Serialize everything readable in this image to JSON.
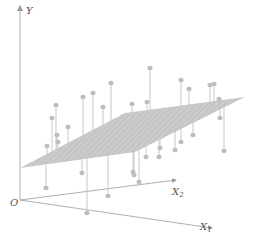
{
  "figure": {
    "axes": {
      "y_label": "Y",
      "x1_label": "X",
      "x1_sub": "1",
      "x2_label": "X",
      "x2_sub": "2",
      "origin_label": "O"
    },
    "colors": {
      "axis": "#9a9a9a",
      "plane": "#c4c4c4",
      "point": "#bdbdbd",
      "stem": "#c8c8c8",
      "label": "#555555"
    },
    "plane": {
      "corners": [
        [
          20,
          168
        ],
        [
          125,
          113
        ],
        [
          245,
          97
        ],
        [
          135,
          152
        ]
      ]
    },
    "points": [
      {
        "x": 52,
        "y": 118,
        "base": 152
      },
      {
        "x": 56,
        "y": 105,
        "base": 150
      },
      {
        "x": 68,
        "y": 127,
        "base": 150
      },
      {
        "x": 93,
        "y": 93,
        "base": 140
      },
      {
        "x": 83,
        "y": 97,
        "base": 142
      },
      {
        "x": 111,
        "y": 83,
        "base": 135
      },
      {
        "x": 103,
        "y": 107,
        "base": 137
      },
      {
        "x": 132,
        "y": 104,
        "base": 128
      },
      {
        "x": 147,
        "y": 102,
        "base": 124
      },
      {
        "x": 150,
        "y": 68,
        "base": 120
      },
      {
        "x": 181,
        "y": 80,
        "base": 113
      },
      {
        "x": 189,
        "y": 89,
        "base": 111
      },
      {
        "x": 210,
        "y": 85,
        "base": 104
      },
      {
        "x": 214,
        "y": 84,
        "base": 104
      },
      {
        "x": 219,
        "y": 99,
        "base": 103
      },
      {
        "x": 220,
        "y": 118,
        "base": 102
      },
      {
        "x": 47,
        "y": 146,
        "base": 158
      },
      {
        "x": 58,
        "y": 142,
        "base": 158
      },
      {
        "x": 57,
        "y": 135,
        "base": 158
      },
      {
        "x": 46,
        "y": 188,
        "base": 165
      },
      {
        "x": 82,
        "y": 173,
        "base": 150
      },
      {
        "x": 87,
        "y": 213,
        "base": 148
      },
      {
        "x": 108,
        "y": 196,
        "base": 142
      },
      {
        "x": 133,
        "y": 172,
        "base": 130
      },
      {
        "x": 146,
        "y": 157,
        "base": 126
      },
      {
        "x": 159,
        "y": 157,
        "base": 124
      },
      {
        "x": 160,
        "y": 148,
        "base": 123
      },
      {
        "x": 175,
        "y": 150,
        "base": 118
      },
      {
        "x": 181,
        "y": 142,
        "base": 116
      },
      {
        "x": 193,
        "y": 135,
        "base": 114
      },
      {
        "x": 224,
        "y": 151,
        "base": 104
      },
      {
        "x": 134,
        "y": 175,
        "base": 130
      },
      {
        "x": 139,
        "y": 182,
        "base": 128
      }
    ]
  }
}
